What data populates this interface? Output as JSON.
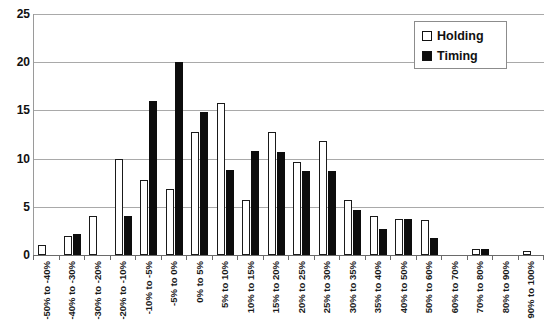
{
  "chart_data": {
    "type": "bar",
    "title": "",
    "xlabel": "",
    "ylabel": "",
    "ylim": [
      0,
      25
    ],
    "yticks": [
      0,
      5,
      10,
      15,
      20,
      25
    ],
    "grid": true,
    "legend_position": "top-right",
    "categories": [
      "-50% to -40%",
      "-40% to -30%",
      "-30% to -20%",
      "-20% to -10%",
      "-10% to -5%",
      "-5% to 0%",
      "0% to 5%",
      "5% to 10%",
      "10% to 15%",
      "15% to 20%",
      "20% to 25%",
      "25% to 30%",
      "30% to 35%",
      "35% to 40%",
      "40% to 50%",
      "50% to 60%",
      "60% to 70%",
      "70% to 80%",
      "80% to 90%",
      "90% to 100%"
    ],
    "series": [
      {
        "name": "Holding",
        "color": "#ffffff",
        "edge_color": "#1a1a1a",
        "values": [
          1.0,
          2.0,
          4.0,
          10.0,
          7.8,
          6.8,
          12.8,
          15.8,
          5.7,
          12.8,
          9.6,
          11.8,
          5.7,
          4.0,
          3.7,
          3.6,
          0.0,
          0.6,
          0.0,
          0.4
        ]
      },
      {
        "name": "Timing",
        "color": "#0d0d0d",
        "edge_color": "#0d0d0d",
        "values": [
          0.0,
          2.2,
          0.0,
          4.0,
          16.0,
          20.0,
          14.8,
          8.8,
          10.8,
          10.7,
          8.7,
          8.7,
          4.7,
          2.7,
          3.7,
          1.8,
          0.0,
          0.6,
          0.0,
          0.0
        ]
      }
    ]
  },
  "legend": {
    "items": [
      {
        "label": "Holding",
        "swatch": "holding-swatch"
      },
      {
        "label": "Timing",
        "swatch": "timing-swatch"
      }
    ]
  }
}
